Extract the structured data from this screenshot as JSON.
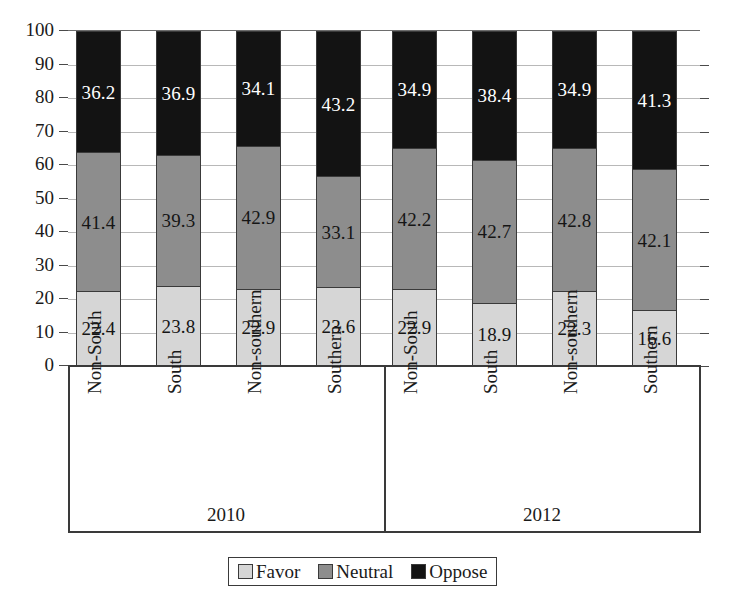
{
  "chart_data": {
    "type": "bar",
    "subtype": "stacked-bar-100",
    "title": "",
    "subtitle": "",
    "xlabel": "",
    "ylabel": "",
    "ylim": [
      0,
      100
    ],
    "y_ticks": [
      0,
      10,
      20,
      30,
      40,
      50,
      60,
      70,
      80,
      90,
      100
    ],
    "y_tick_labels": [
      "0",
      "10",
      "20",
      "30",
      "40",
      "50",
      "60",
      "70",
      "80",
      "90",
      "100"
    ],
    "grid": true,
    "grid_axis": "y",
    "legend_position": "bottom",
    "stack_order_bottom_to_top": [
      "Favor",
      "Neutral",
      "Oppose"
    ],
    "groups": [
      {
        "name": "2010",
        "categories": [
          "Non-South",
          "South",
          "Non-southern",
          "Southern"
        ]
      },
      {
        "name": "2012",
        "categories": [
          "Non-South",
          "South",
          "Non-southern",
          "Southern"
        ]
      }
    ],
    "categories": [
      "Non-South",
      "South",
      "Non-southern",
      "Southern",
      "Non-South",
      "South",
      "Non-southern",
      "Southern"
    ],
    "series": [
      {
        "name": "Favor",
        "color": "#d6d6d6",
        "values": [
          22.4,
          23.8,
          22.9,
          23.6,
          22.9,
          18.9,
          22.3,
          16.6
        ]
      },
      {
        "name": "Neutral",
        "color": "#8d8d8d",
        "values": [
          41.4,
          39.3,
          42.9,
          33.1,
          42.2,
          42.7,
          42.8,
          42.1
        ]
      },
      {
        "name": "Oppose",
        "color": "#131313",
        "values": [
          36.2,
          36.9,
          34.1,
          43.2,
          34.9,
          38.4,
          34.9,
          41.3
        ]
      }
    ],
    "bars": [
      {
        "group": "2010",
        "category": "Non-South",
        "Favor": 22.4,
        "Neutral": 41.4,
        "Oppose": 36.2
      },
      {
        "group": "2010",
        "category": "South",
        "Favor": 23.8,
        "Neutral": 39.3,
        "Oppose": 36.9
      },
      {
        "group": "2010",
        "category": "Non-southern",
        "Favor": 22.9,
        "Neutral": 42.9,
        "Oppose": 34.1
      },
      {
        "group": "2010",
        "category": "Southern",
        "Favor": 23.6,
        "Neutral": 33.1,
        "Oppose": 43.2
      },
      {
        "group": "2012",
        "category": "Non-South",
        "Favor": 22.9,
        "Neutral": 42.2,
        "Oppose": 34.9
      },
      {
        "group": "2012",
        "category": "South",
        "Favor": 18.9,
        "Neutral": 42.7,
        "Oppose": 38.4
      },
      {
        "group": "2012",
        "category": "Non-southern",
        "Favor": 22.3,
        "Neutral": 42.8,
        "Oppose": 34.9
      },
      {
        "group": "2012",
        "category": "Southern",
        "Favor": 16.6,
        "Neutral": 42.1,
        "Oppose": 41.3
      }
    ],
    "legend": [
      {
        "label": "Favor",
        "color": "#d6d6d6"
      },
      {
        "label": "Neutral",
        "color": "#8d8d8d"
      },
      {
        "label": "Oppose",
        "color": "#131313"
      }
    ]
  }
}
